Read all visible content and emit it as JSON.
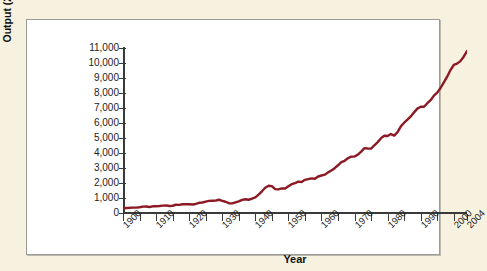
{
  "chart_data": {
    "type": "line",
    "title": "",
    "xlabel": "Year",
    "ylabel": "Output (2000 $, billions)",
    "xlim": [
      1900,
      2004
    ],
    "ylim": [
      0,
      11000
    ],
    "grid": false,
    "legend": false,
    "line_color": "#8B1A24",
    "y_ticks": [
      0,
      1000,
      2000,
      3000,
      4000,
      5000,
      6000,
      7000,
      8000,
      9000,
      10000,
      11000
    ],
    "y_tick_labels": [
      "0",
      "1,000",
      "2,000",
      "3,000",
      "4,000",
      "5,000",
      "6,000",
      "7,000",
      "8,000",
      "9,000",
      "10,000",
      "11,000"
    ],
    "x_ticks": [
      1900,
      1905,
      1910,
      1915,
      1920,
      1925,
      1930,
      1935,
      1940,
      1945,
      1950,
      1955,
      1960,
      1965,
      1970,
      1975,
      1980,
      1985,
      1990,
      1995,
      2000,
      2004
    ],
    "x_tick_labels": [
      "1900",
      "1910",
      "1920",
      "1930",
      "1940",
      "1950",
      "1960",
      "1970",
      "1980",
      "1990",
      "2000",
      "2004"
    ],
    "x_labeled_years": [
      1900,
      1910,
      1920,
      1930,
      1940,
      1950,
      1960,
      1970,
      1980,
      1990,
      2000,
      2004
    ],
    "series": [
      {
        "name": "Real output",
        "x": [
          1900,
          1901,
          1902,
          1903,
          1904,
          1905,
          1906,
          1907,
          1908,
          1909,
          1910,
          1911,
          1912,
          1913,
          1914,
          1915,
          1916,
          1917,
          1918,
          1919,
          1920,
          1921,
          1922,
          1923,
          1924,
          1925,
          1926,
          1927,
          1928,
          1929,
          1930,
          1931,
          1932,
          1933,
          1934,
          1935,
          1936,
          1937,
          1938,
          1939,
          1940,
          1941,
          1942,
          1943,
          1944,
          1945,
          1946,
          1947,
          1948,
          1949,
          1950,
          1951,
          1952,
          1953,
          1954,
          1955,
          1956,
          1957,
          1958,
          1959,
          1960,
          1961,
          1962,
          1963,
          1964,
          1965,
          1966,
          1967,
          1968,
          1969,
          1970,
          1971,
          1972,
          1973,
          1974,
          1975,
          1976,
          1977,
          1978,
          1979,
          1980,
          1981,
          1982,
          1983,
          1984,
          1985,
          1986,
          1987,
          1988,
          1989,
          1990,
          1991,
          1992,
          1993,
          1994,
          1995,
          1996,
          1997,
          1998,
          1999,
          2000,
          2001,
          2002,
          2003,
          2004
        ],
        "values": [
          380,
          420,
          430,
          450,
          445,
          480,
          530,
          540,
          495,
          555,
          565,
          585,
          615,
          635,
          585,
          600,
          685,
          675,
          730,
          735,
          730,
          710,
          750,
          845,
          870,
          950,
          1010,
          1020,
          1030,
          1100,
          1000,
          935,
          815,
          800,
          885,
          965,
          1090,
          1140,
          1100,
          1190,
          1290,
          1520,
          1800,
          2100,
          2260,
          2230,
          1980,
          1960,
          2040,
          2030,
          2210,
          2390,
          2480,
          2600,
          2570,
          2750,
          2810,
          2870,
          2840,
          3030,
          3110,
          3180,
          3370,
          3520,
          3720,
          3960,
          4220,
          4330,
          4540,
          4680,
          4690,
          4840,
          5090,
          5380,
          5350,
          5340,
          5620,
          5880,
          6210,
          6410,
          6390,
          6550,
          6420,
          6710,
          7190,
          7490,
          7740,
          8010,
          8350,
          8660,
          8820,
          8810,
          9110,
          9360,
          9740,
          9990,
          10370,
          10830,
          11310,
          11860,
          12280,
          12390,
          12600,
          12970,
          13440
        ]
      }
    ],
    "note_series_scaled": true,
    "annotations": []
  },
  "figure": {
    "background_color": "#f7f2df",
    "panel_color": "#ffffff",
    "panel_border_color": "#9c9c96",
    "axis_color": "#3a3a3a"
  }
}
